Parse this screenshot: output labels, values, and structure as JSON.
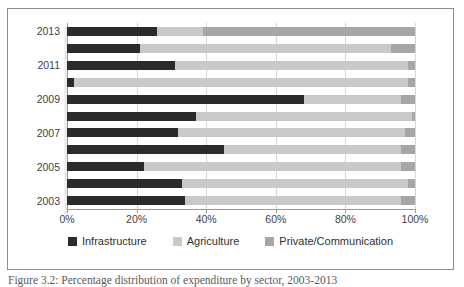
{
  "figure": {
    "caption": "Figure 3.2: Percentage distribution of expenditure by sector, 2003-2013"
  },
  "legend": {
    "position": "bottom-center",
    "items": [
      {
        "label": "Infrastructure",
        "color": "#2b2b2b"
      },
      {
        "label": "Agriculture",
        "color": "#c9c9c9"
      },
      {
        "label": "Private/Communication",
        "color": "#a6a6a6"
      }
    ]
  },
  "axes": {
    "x_ticks": [
      "0%",
      "20%",
      "40%",
      "60%",
      "80%",
      "100%"
    ],
    "x_tick_values": [
      0,
      20,
      40,
      60,
      80,
      100
    ],
    "y_ticks": [
      "2013",
      "2011",
      "2009",
      "2007",
      "2005",
      "2003"
    ]
  },
  "chart_data": {
    "type": "bar",
    "orientation": "horizontal",
    "stacked": true,
    "normalized": true,
    "title": "",
    "xlabel": "",
    "ylabel": "",
    "xlim": [
      0,
      100
    ],
    "grid": true,
    "legend_position": "bottom-center",
    "categories": [
      "2013",
      "2012",
      "2011",
      "2010",
      "2009",
      "2008",
      "2007",
      "2006",
      "2005",
      "2004",
      "2003"
    ],
    "y_tick_labels": [
      "2013",
      "2011",
      "2009",
      "2007",
      "2005",
      "2003"
    ],
    "series": [
      {
        "name": "Infrastructure",
        "color": "#2b2b2b",
        "values": [
          26,
          21,
          31,
          2,
          68,
          37,
          32,
          45,
          22,
          33,
          34
        ]
      },
      {
        "name": "Agriculture",
        "color": "#c9c9c9",
        "values": [
          13,
          72,
          67,
          96,
          28,
          62,
          65,
          51,
          74,
          65,
          62
        ]
      },
      {
        "name": "Private/Communication",
        "color": "#a6a6a6",
        "values": [
          61,
          7,
          2,
          2,
          4,
          1,
          3,
          4,
          4,
          2,
          4
        ]
      }
    ]
  }
}
